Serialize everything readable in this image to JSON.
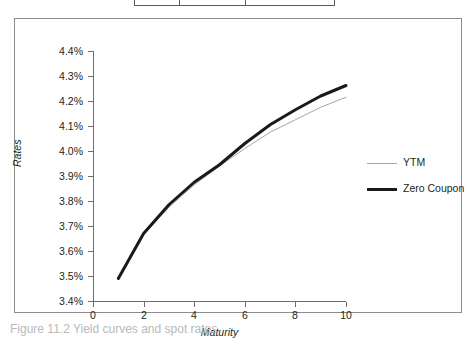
{
  "figure": {
    "caption": "Figure 11.2  Yield curves and spot rates"
  },
  "table_remnant": {
    "note": "bottom edge of a data table, cropped above the figure"
  },
  "legend": {
    "position": "right",
    "entries": [
      {
        "label": "YTM",
        "swatch": "thin-line",
        "color": "#a6a6a6"
      },
      {
        "label": "Zero Coupon",
        "swatch": "thick-line",
        "color": "#1a1a1a"
      }
    ]
  },
  "chart_data": {
    "type": "line",
    "title": "",
    "xlabel": "Maturity",
    "ylabel": "Rates",
    "xlim": [
      0,
      10
    ],
    "ylim": [
      3.4,
      4.4
    ],
    "grid": false,
    "legend_position": "right",
    "x_ticks": [
      0,
      2,
      4,
      6,
      8,
      10
    ],
    "x_tick_labels": [
      "0",
      "2",
      "4",
      "6",
      "8",
      "10"
    ],
    "y_ticks": [
      3.4,
      3.5,
      3.6,
      3.7,
      3.8,
      3.9,
      4.0,
      4.1,
      4.2,
      4.3,
      4.4
    ],
    "y_tick_labels": [
      "3.4%",
      "3.5%",
      "3.6%",
      "3.7%",
      "3.8%",
      "3.9%",
      "4.0%",
      "4.1%",
      "4.2%",
      "4.3%",
      "4.4%"
    ],
    "x": [
      1,
      2,
      3,
      4,
      5,
      6,
      7,
      8,
      9,
      10
    ],
    "series": [
      {
        "name": "YTM",
        "color": "#a6a6a6",
        "width": 1,
        "values": [
          3.49,
          3.665,
          3.775,
          3.865,
          3.94,
          4.01,
          4.075,
          4.125,
          4.175,
          4.215
        ]
      },
      {
        "name": "Zero Coupon",
        "color": "#1a1a1a",
        "width": 3,
        "values": [
          3.49,
          3.67,
          3.785,
          3.875,
          3.945,
          4.03,
          4.105,
          4.165,
          4.22,
          4.262
        ]
      }
    ]
  }
}
